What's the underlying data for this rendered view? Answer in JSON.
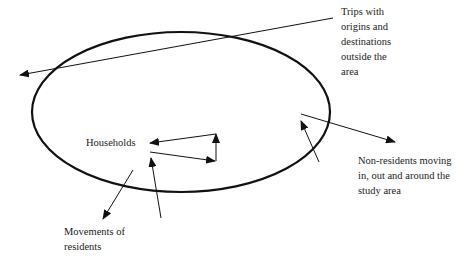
{
  "diagram": {
    "labels": {
      "trips_outside": [
        "Trips with",
        "origins and",
        "destinations",
        "outside the",
        "area"
      ],
      "households": "Households",
      "movements_residents": [
        "Movements of",
        "residents"
      ],
      "non_residents": [
        "Non-residents moving",
        "in, out and around the",
        "study area"
      ]
    },
    "colors": {
      "stroke": "#111111",
      "text": "#222222",
      "background": "#ffffff"
    }
  }
}
